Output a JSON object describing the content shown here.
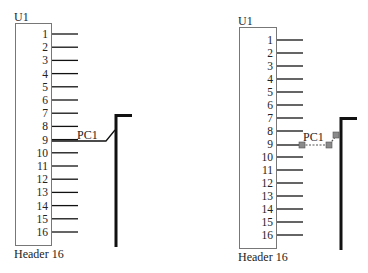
{
  "colors": {
    "wire": "#111111",
    "box_stroke": "#777777",
    "grip": "#8a8a8a",
    "selection": "#666666"
  },
  "left": {
    "designator": "U1",
    "comment": "Header 16",
    "net_label": "PC1",
    "pins": [
      "1",
      "2",
      "3",
      "4",
      "5",
      "6",
      "7",
      "8",
      "9",
      "10",
      "11",
      "12",
      "13",
      "14",
      "15",
      "16"
    ]
  },
  "right": {
    "designator": "U1",
    "comment": "Header 16",
    "net_label": "PC1",
    "selected": true,
    "pins": [
      "1",
      "2",
      "3",
      "4",
      "5",
      "6",
      "7",
      "8",
      "9",
      "10",
      "11",
      "12",
      "13",
      "14",
      "15",
      "16"
    ]
  }
}
